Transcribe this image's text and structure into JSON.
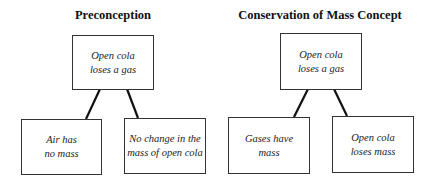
{
  "diagrams": [
    {
      "title": "Preconception",
      "root": {
        "line1": "Open cola",
        "line2": "loses a gas"
      },
      "children": [
        {
          "line1": "Air has",
          "line2": "no mass"
        },
        {
          "line1": "No change in the",
          "line2": "mass of open cola"
        }
      ]
    },
    {
      "title": "Conservation of Mass Concept",
      "root": {
        "line1": "Open cola",
        "line2": "loses a gas"
      },
      "children": [
        {
          "line1": "Gases have",
          "line2": "mass"
        },
        {
          "line1": "Open cola",
          "line2": "loses mass"
        }
      ]
    }
  ]
}
